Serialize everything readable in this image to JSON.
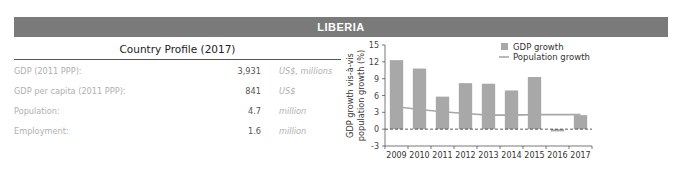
{
  "header": {
    "title": "LIBERIA",
    "bar_color": "#7a7a7a"
  },
  "profile": {
    "title": "Country Profile (2017)",
    "rows": [
      {
        "label": "GDP (2011 PPP):",
        "value": "3,931",
        "unit": "US$, millions"
      },
      {
        "label": "GDP per capita (2011 PPP):",
        "value": "841",
        "unit": "US$"
      },
      {
        "label": "Population:",
        "value": "4.7",
        "unit": "million"
      },
      {
        "label": "Employment:",
        "value": "1.6",
        "unit": "million"
      }
    ]
  },
  "chart_data": {
    "type": "bar",
    "title": "",
    "xlabel": "",
    "ylabel": "GDP growth vis-à-vis population growth (%)",
    "ylabel_lines": [
      "GDP growth vis-à-vis",
      "population growth (%)"
    ],
    "categories": [
      "2009",
      "2010",
      "2011",
      "2012",
      "2013",
      "2014",
      "2015",
      "2016",
      "2017"
    ],
    "series": [
      {
        "name": "GDP growth",
        "type": "bar",
        "color": "#a8a8a8",
        "values": [
          12.3,
          10.8,
          5.8,
          8.2,
          8.1,
          6.9,
          9.3,
          -0.4,
          2.5
        ]
      },
      {
        "name": "Population growth",
        "type": "line",
        "color": "#a8a8a8",
        "values": [
          4.0,
          3.5,
          3.1,
          2.8,
          2.5,
          2.5,
          2.6,
          2.6,
          2.6
        ]
      }
    ],
    "ylim": [
      -3,
      15
    ],
    "yticks": [
      -3,
      0,
      3,
      6,
      9,
      12,
      15
    ],
    "ytick_labels": [
      "-3",
      "0",
      "3",
      "6",
      "9",
      "12",
      "15"
    ],
    "zero_line": "dashed",
    "grid": false,
    "legend": {
      "position": "top-right",
      "entries": [
        "GDP growth",
        "Population growth"
      ]
    }
  }
}
